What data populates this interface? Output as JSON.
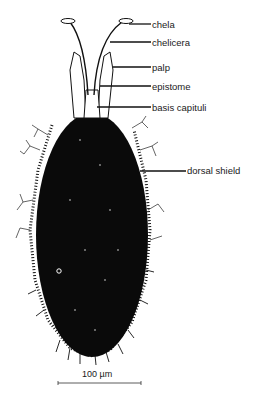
{
  "figure": {
    "labels": [
      {
        "id": "chela",
        "text": "chela",
        "x": 152,
        "y": 20,
        "line_from_x": 129,
        "line_y": 24
      },
      {
        "id": "chelicera",
        "text": "chelicera",
        "x": 152,
        "y": 38,
        "line_from_x": 110,
        "line_y": 42
      },
      {
        "id": "palp",
        "text": "palp",
        "x": 152,
        "y": 63,
        "line_from_x": 113,
        "line_y": 67
      },
      {
        "id": "epistome",
        "text": "epistome",
        "x": 152,
        "y": 82,
        "line_from_x": 100,
        "line_y": 86
      },
      {
        "id": "basis_capituli",
        "text": "basis capituli",
        "x": 152,
        "y": 103,
        "line_from_x": 97,
        "line_y": 107
      },
      {
        "id": "dorsal_shield",
        "text": "dorsal shield",
        "x": 187,
        "y": 166,
        "line_from_x": 140,
        "line_y": 171
      }
    ],
    "scale_bar": {
      "text": "100 µm",
      "x1": 58,
      "x2": 141,
      "y": 383
    }
  },
  "colors": {
    "ink": "#0a0a0a",
    "background": "#ffffff"
  }
}
